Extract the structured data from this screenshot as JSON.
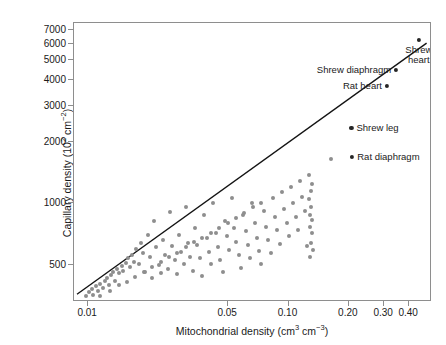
{
  "chart_data": {
    "type": "scatter",
    "title": "",
    "xlabel": "Mitochondrial density (cm3 cm-3)",
    "xlabel_parts": {
      "text": "Mitochondrial density (cm",
      "sup1": "3",
      "mid": " cm",
      "sup2": "−3",
      "close": ")"
    },
    "ylabel": "Capillary density (102 cm-2)",
    "ylabel_parts": {
      "text": "Capillary density (10",
      "sup1": "2",
      "mid": " cm",
      "sup2": "−2",
      "close": ")"
    },
    "xscale": "log",
    "yscale": "log",
    "xlim": [
      0.0085,
      0.52
    ],
    "ylim": [
      330,
      7600
    ],
    "grid": false,
    "legend": null,
    "xticks": [
      {
        "value": 0.01,
        "label": "0.01"
      },
      {
        "value": 0.05,
        "label": "0.05"
      },
      {
        "value": 0.1,
        "label": "0.10"
      },
      {
        "value": 0.2,
        "label": "0.20"
      },
      {
        "value": 0.3,
        "label": "0.30"
      },
      {
        "value": 0.4,
        "label": "0.40"
      }
    ],
    "yticks": [
      {
        "value": 500,
        "label": "500"
      },
      {
        "value": 1000,
        "label": "1000"
      },
      {
        "value": 2000,
        "label": "2000"
      },
      {
        "value": 3000,
        "label": "3000"
      },
      {
        "value": 4000,
        "label": "4000"
      },
      {
        "value": 5000,
        "label": "5000"
      },
      {
        "value": 6000,
        "label": "6000"
      },
      {
        "value": 7000,
        "label": "7000"
      }
    ],
    "colors": {
      "cloud_points": "#8e8e8e",
      "highlight_points": "#262626",
      "regression_line": "#141414",
      "axis": "#8e8e8e",
      "text": "#1a1a1a",
      "background": "#ffffff"
    },
    "regression_line": {
      "label": "allometric fit",
      "x_start": 0.0088,
      "y_start": 352,
      "x_end": 0.5,
      "y_end": 6050
    },
    "labeled_points": [
      {
        "name": "Shrew heart",
        "label": "Shrew heart",
        "x": 0.447,
        "y": 6290,
        "label_pos": "below"
      },
      {
        "name": "Shrew diaphragm",
        "label": "Shrew diaphragm",
        "x": 0.345,
        "y": 4480,
        "label_pos": "left"
      },
      {
        "name": "Rat heart",
        "label": "Rat heart",
        "x": 0.31,
        "y": 3760,
        "label_pos": "left"
      },
      {
        "name": "Shrew leg",
        "label": "Shrew leg",
        "x": 0.206,
        "y": 2330,
        "label_pos": "right"
      },
      {
        "name": "Rat diaphragm",
        "label": "Rat diaphragm",
        "x": 0.208,
        "y": 1690,
        "label_pos": "right"
      }
    ],
    "points": [
      [
        0.0098,
        352
      ],
      [
        0.0101,
        368
      ],
      [
        0.0104,
        381
      ],
      [
        0.0106,
        357
      ],
      [
        0.011,
        396
      ],
      [
        0.0112,
        372
      ],
      [
        0.0115,
        404
      ],
      [
        0.0118,
        388
      ],
      [
        0.0121,
        418
      ],
      [
        0.0124,
        432
      ],
      [
        0.0127,
        400
      ],
      [
        0.013,
        445
      ],
      [
        0.0133,
        462
      ],
      [
        0.0136,
        420
      ],
      [
        0.014,
        478
      ],
      [
        0.0143,
        455
      ],
      [
        0.0147,
        492
      ],
      [
        0.015,
        470
      ],
      [
        0.0154,
        512
      ],
      [
        0.0158,
        540
      ],
      [
        0.0162,
        487
      ],
      [
        0.0166,
        560
      ],
      [
        0.017,
        520
      ],
      [
        0.0174,
        600
      ],
      [
        0.0179,
        505
      ],
      [
        0.0183,
        640
      ],
      [
        0.0188,
        575
      ],
      [
        0.0193,
        462
      ],
      [
        0.0198,
        700
      ],
      [
        0.0203,
        545
      ],
      [
        0.0208,
        430
      ],
      [
        0.0214,
        820
      ],
      [
        0.0219,
        610
      ],
      [
        0.0225,
        500
      ],
      [
        0.0231,
        455
      ],
      [
        0.0237,
        660
      ],
      [
        0.0243,
        560
      ],
      [
        0.025,
        480
      ],
      [
        0.0256,
        905
      ],
      [
        0.0263,
        620
      ],
      [
        0.027,
        530
      ],
      [
        0.0277,
        450
      ],
      [
        0.0284,
        700
      ],
      [
        0.0292,
        580
      ],
      [
        0.03,
        505
      ],
      [
        0.0308,
        965
      ],
      [
        0.0316,
        640
      ],
      [
        0.0324,
        545
      ],
      [
        0.0333,
        470
      ],
      [
        0.0342,
        760
      ],
      [
        0.0351,
        625
      ],
      [
        0.036,
        540
      ],
      [
        0.037,
        440
      ],
      [
        0.038,
        880
      ],
      [
        0.039,
        680
      ],
      [
        0.04,
        580
      ],
      [
        0.0411,
        505
      ],
      [
        0.0422,
        1010
      ],
      [
        0.0433,
        720
      ],
      [
        0.0445,
        615
      ],
      [
        0.0457,
        530
      ],
      [
        0.0469,
        460
      ],
      [
        0.0481,
        820
      ],
      [
        0.0494,
        690
      ],
      [
        0.0507,
        590
      ],
      [
        0.0521,
        1060
      ],
      [
        0.0535,
        760
      ],
      [
        0.0549,
        650
      ],
      [
        0.0563,
        560
      ],
      [
        0.0578,
        485
      ],
      [
        0.0594,
        880
      ],
      [
        0.061,
        730
      ],
      [
        0.0626,
        625
      ],
      [
        0.0642,
        540
      ],
      [
        0.0659,
        1000
      ],
      [
        0.0677,
        800
      ],
      [
        0.0695,
        680
      ],
      [
        0.0713,
        585
      ],
      [
        0.0732,
        505
      ],
      [
        0.0752,
        920
      ],
      [
        0.0772,
        770
      ],
      [
        0.0792,
        660
      ],
      [
        0.0813,
        570
      ],
      [
        0.0835,
        1060
      ],
      [
        0.0857,
        860
      ],
      [
        0.088,
        740
      ],
      [
        0.0903,
        635
      ],
      [
        0.0927,
        1140
      ],
      [
        0.0952,
        940
      ],
      [
        0.0977,
        800
      ],
      [
        0.1003,
        690
      ],
      [
        0.103,
        1200
      ],
      [
        0.1057,
        1010
      ],
      [
        0.1085,
        860
      ],
      [
        0.1114,
        740
      ],
      [
        0.1144,
        1290
      ],
      [
        0.1174,
        1080
      ],
      [
        0.1205,
        915
      ],
      [
        0.1237,
        620
      ],
      [
        0.127,
        1380
      ],
      [
        0.127,
        1050
      ],
      [
        0.1275,
        770
      ],
      [
        0.128,
        545
      ],
      [
        0.1285,
        880
      ],
      [
        0.129,
        640
      ],
      [
        0.1295,
        1150
      ],
      [
        0.13,
        960
      ],
      [
        0.1305,
        720
      ],
      [
        0.131,
        1240
      ],
      [
        0.1315,
        830
      ],
      [
        0.132,
        590
      ],
      [
        0.162,
        1640
      ],
      [
        0.0115,
        355
      ],
      [
        0.0128,
        375
      ],
      [
        0.0142,
        398
      ],
      [
        0.0156,
        415
      ],
      [
        0.0172,
        438
      ],
      [
        0.019,
        462
      ],
      [
        0.0209,
        490
      ],
      [
        0.023,
        515
      ],
      [
        0.0253,
        545
      ],
      [
        0.0279,
        575
      ],
      [
        0.0307,
        610
      ],
      [
        0.0338,
        645
      ],
      [
        0.0372,
        680
      ],
      [
        0.041,
        720
      ],
      [
        0.0451,
        760
      ],
      [
        0.0497,
        805
      ],
      [
        0.0547,
        850
      ],
      [
        0.0602,
        900
      ],
      [
        0.0663,
        955
      ],
      [
        0.073,
        1010
      ]
    ]
  }
}
